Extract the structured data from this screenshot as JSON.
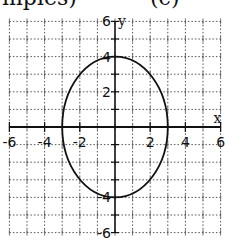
{
  "header": {
    "clipped_text_left": "mples)",
    "clipped_text_right": "(c)"
  },
  "chart_data": {
    "type": "line",
    "title": "",
    "xlabel": "x",
    "ylabel": "y",
    "xlim": [
      -6,
      6
    ],
    "ylim": [
      -6,
      6
    ],
    "grid": true,
    "grid_style": "dotted",
    "x_tick_labels": [
      "-6",
      "-4",
      "-2",
      "2",
      "4",
      "6"
    ],
    "x_ticks": [
      -6,
      -4,
      -2,
      2,
      4,
      6
    ],
    "y_tick_labels": [
      "6",
      "4",
      "2",
      "-4",
      "-6"
    ],
    "y_ticks": [
      6,
      4,
      2,
      -4,
      -6
    ],
    "series": [
      {
        "name": "ellipse",
        "shape": "ellipse",
        "center": [
          0,
          0
        ],
        "semi_axis_x": 3,
        "semi_axis_y": 4,
        "x_intercepts": [
          -3,
          3
        ],
        "y_intercepts": [
          -4,
          4
        ]
      }
    ],
    "colors": {
      "curve": "#111111",
      "axes": "#111111",
      "grid": "#555555"
    }
  }
}
